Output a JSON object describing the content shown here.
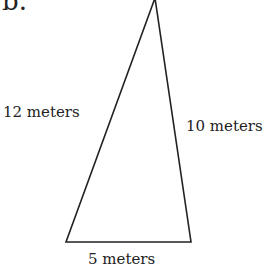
{
  "figure": {
    "label": "b.",
    "shape": "triangle",
    "sides": {
      "left": "12 meters",
      "right": "10 meters",
      "bottom": "5 meters"
    },
    "vertices": {
      "apex": [
        155,
        -2
      ],
      "bottom_left": [
        66,
        242
      ],
      "bottom_right": [
        191,
        242
      ]
    },
    "stroke_color": "#222222"
  }
}
